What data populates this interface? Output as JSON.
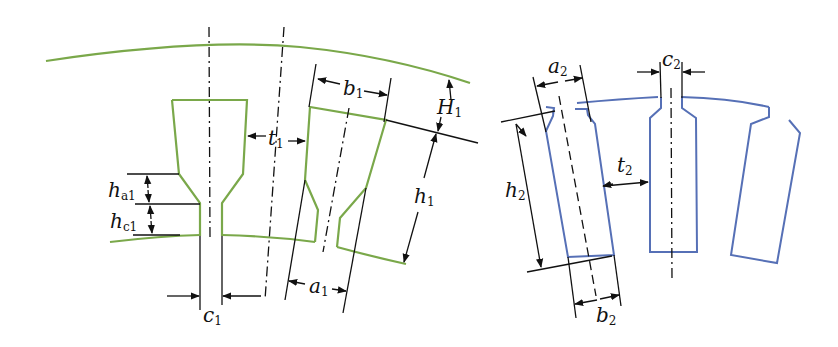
{
  "figure": {
    "colors": {
      "stator": "#7aa84a",
      "rotor": "#5670b6",
      "dimension": "#111111",
      "background": "#ffffff"
    },
    "stator_diagram": {
      "labels": {
        "b1": {
          "main": "b",
          "sub": "1"
        },
        "t1": {
          "main": "t",
          "sub": "1"
        },
        "H1": {
          "main": "H",
          "sub": "1"
        },
        "h1": {
          "main": "h",
          "sub": "1"
        },
        "ha1": {
          "main": "h",
          "sub": "a1"
        },
        "hc1": {
          "main": "h",
          "sub": "c1"
        },
        "c1": {
          "main": "c",
          "sub": "1"
        },
        "a1": {
          "main": "a",
          "sub": "1"
        }
      }
    },
    "rotor_diagram": {
      "labels": {
        "a2": {
          "main": "a",
          "sub": "2"
        },
        "c2": {
          "main": "c",
          "sub": "2"
        },
        "t2": {
          "main": "t",
          "sub": "2"
        },
        "h2": {
          "main": "h",
          "sub": "2"
        },
        "b2": {
          "main": "b",
          "sub": "2"
        }
      }
    }
  }
}
